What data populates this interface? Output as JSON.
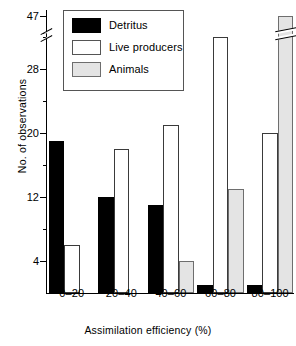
{
  "chart_data": {
    "type": "bar",
    "title": "",
    "xlabel": "Assimilation efficiency (%)",
    "ylabel": "No. of observations",
    "categories": [
      "0-20",
      "20-40",
      "40-60",
      "60-80",
      "80-100"
    ],
    "series": [
      {
        "name": "Detritus",
        "color": "#000000",
        "values": [
          19,
          12,
          11,
          1,
          1
        ]
      },
      {
        "name": "Live producers",
        "color": "#ffffff",
        "values": [
          6,
          18,
          21,
          32,
          20
        ]
      },
      {
        "name": "Animals",
        "color": "#e4e4e4",
        "values": [
          0,
          0,
          4,
          13,
          47
        ]
      }
    ],
    "ylim": [
      0,
      47
    ],
    "yticks": [
      4,
      12,
      20,
      28,
      47
    ],
    "ytick_labels": [
      "4",
      "12",
      "20",
      "28",
      "47"
    ],
    "y_axis_break": true,
    "y_axis_break_note": "axis broken between 28 and 47",
    "bar_break_note": "tallest bar (Animals, 80-100) drawn with break mark",
    "grid": false,
    "legend_position": "top-left"
  },
  "legend": {
    "items": [
      {
        "label": "Detritus",
        "swatch": "black-filled-rectangle"
      },
      {
        "label": "Live producers",
        "swatch": "white-filled-rectangle"
      },
      {
        "label": "Animals",
        "swatch": "gray-filled-rectangle"
      }
    ]
  },
  "axes": {
    "y_title": "No. of observations",
    "x_title": "Assimilation efficiency (%)",
    "y_tick_labels": [
      "47",
      "28",
      "20",
      "12",
      "4"
    ],
    "x_tick_labels": [
      "0-20",
      "20-40",
      "40-60",
      "60-80",
      "80-100"
    ]
  }
}
